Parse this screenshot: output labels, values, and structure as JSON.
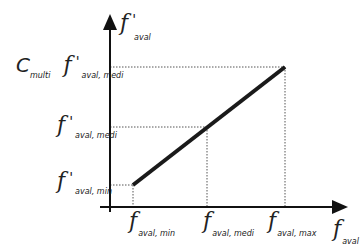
{
  "diagram": {
    "type": "linear-mapping",
    "colors": {
      "axis": "#111111",
      "line": "#1a1a1a",
      "guide": "#555555",
      "text": "#222222"
    },
    "y_axis": {
      "symbol": "f",
      "prime": "'",
      "sub": "aval"
    },
    "x_axis": {
      "symbol": "f",
      "sub": "aval"
    },
    "y_labels": {
      "top": {
        "prefix": "C",
        "prefix_sub": "multi",
        "symbol": "f",
        "prime": "'",
        "sub": "aval, medi"
      },
      "mid": {
        "symbol": "f",
        "prime": "'",
        "sub": "aval, medi"
      },
      "min": {
        "symbol": "f",
        "prime": "'",
        "sub": "aval, min"
      }
    },
    "x_labels": {
      "min": {
        "symbol": "f",
        "sub": "aval, min"
      },
      "medi": {
        "symbol": "f",
        "sub": "aval, medi"
      },
      "max": {
        "symbol": "f",
        "sub": "aval, max"
      }
    },
    "points": [
      {
        "name": "min",
        "x": 133,
        "y": 185
      },
      {
        "name": "medi",
        "x": 207,
        "y": 127
      },
      {
        "name": "max",
        "x": 285,
        "y": 67
      }
    ]
  }
}
